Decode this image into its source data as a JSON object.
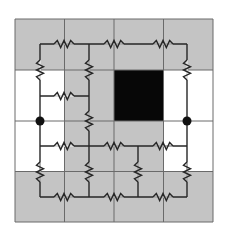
{
  "diagram": {
    "type": "resistor-network-on-grid",
    "grid": {
      "rows": 4,
      "cols": 4,
      "x_lines": [
        15,
        64.5,
        114,
        163.5,
        213
      ],
      "y_lines": [
        19,
        70,
        121,
        171.5,
        222
      ],
      "cells": [
        [
          "gray",
          "gray",
          "gray",
          "gray"
        ],
        [
          "white",
          "gray",
          "black",
          "white"
        ],
        [
          "white",
          "gray",
          "gray",
          "white"
        ],
        [
          "gray",
          "gray",
          "gray",
          "gray"
        ]
      ]
    },
    "colors": {
      "gray": "#c4c4c4",
      "white": "#ffffff",
      "black": "#070707",
      "grid_line": "#6a6a6a",
      "wire": "#262626"
    },
    "wires": [
      [
        40,
        44,
        187,
        44
      ],
      [
        40,
        44,
        40,
        197
      ],
      [
        89,
        44,
        89,
        197
      ],
      [
        187,
        44,
        187,
        197
      ],
      [
        40,
        96,
        89,
        96
      ],
      [
        40,
        146,
        187,
        146
      ],
      [
        138,
        146,
        138,
        197
      ],
      [
        40,
        197,
        187,
        197
      ]
    ],
    "resistors": [
      {
        "orientation": "h",
        "x": 64,
        "y": 44
      },
      {
        "orientation": "h",
        "x": 114,
        "y": 44
      },
      {
        "orientation": "h",
        "x": 163,
        "y": 44
      },
      {
        "orientation": "v",
        "x": 40,
        "y": 70
      },
      {
        "orientation": "v",
        "x": 89,
        "y": 70
      },
      {
        "orientation": "v",
        "x": 187,
        "y": 70
      },
      {
        "orientation": "h",
        "x": 64,
        "y": 96
      },
      {
        "orientation": "v",
        "x": 89,
        "y": 121
      },
      {
        "orientation": "h",
        "x": 64,
        "y": 146
      },
      {
        "orientation": "h",
        "x": 114,
        "y": 146
      },
      {
        "orientation": "h",
        "x": 163,
        "y": 146
      },
      {
        "orientation": "v",
        "x": 40,
        "y": 172
      },
      {
        "orientation": "v",
        "x": 89,
        "y": 172
      },
      {
        "orientation": "v",
        "x": 138,
        "y": 172
      },
      {
        "orientation": "v",
        "x": 187,
        "y": 172
      },
      {
        "orientation": "h",
        "x": 64,
        "y": 197
      },
      {
        "orientation": "h",
        "x": 114,
        "y": 197
      },
      {
        "orientation": "h",
        "x": 163,
        "y": 197
      }
    ],
    "terminals": [
      {
        "name": "left-terminal",
        "x": 40,
        "y": 121
      },
      {
        "name": "right-terminal",
        "x": 187,
        "y": 121
      }
    ]
  }
}
